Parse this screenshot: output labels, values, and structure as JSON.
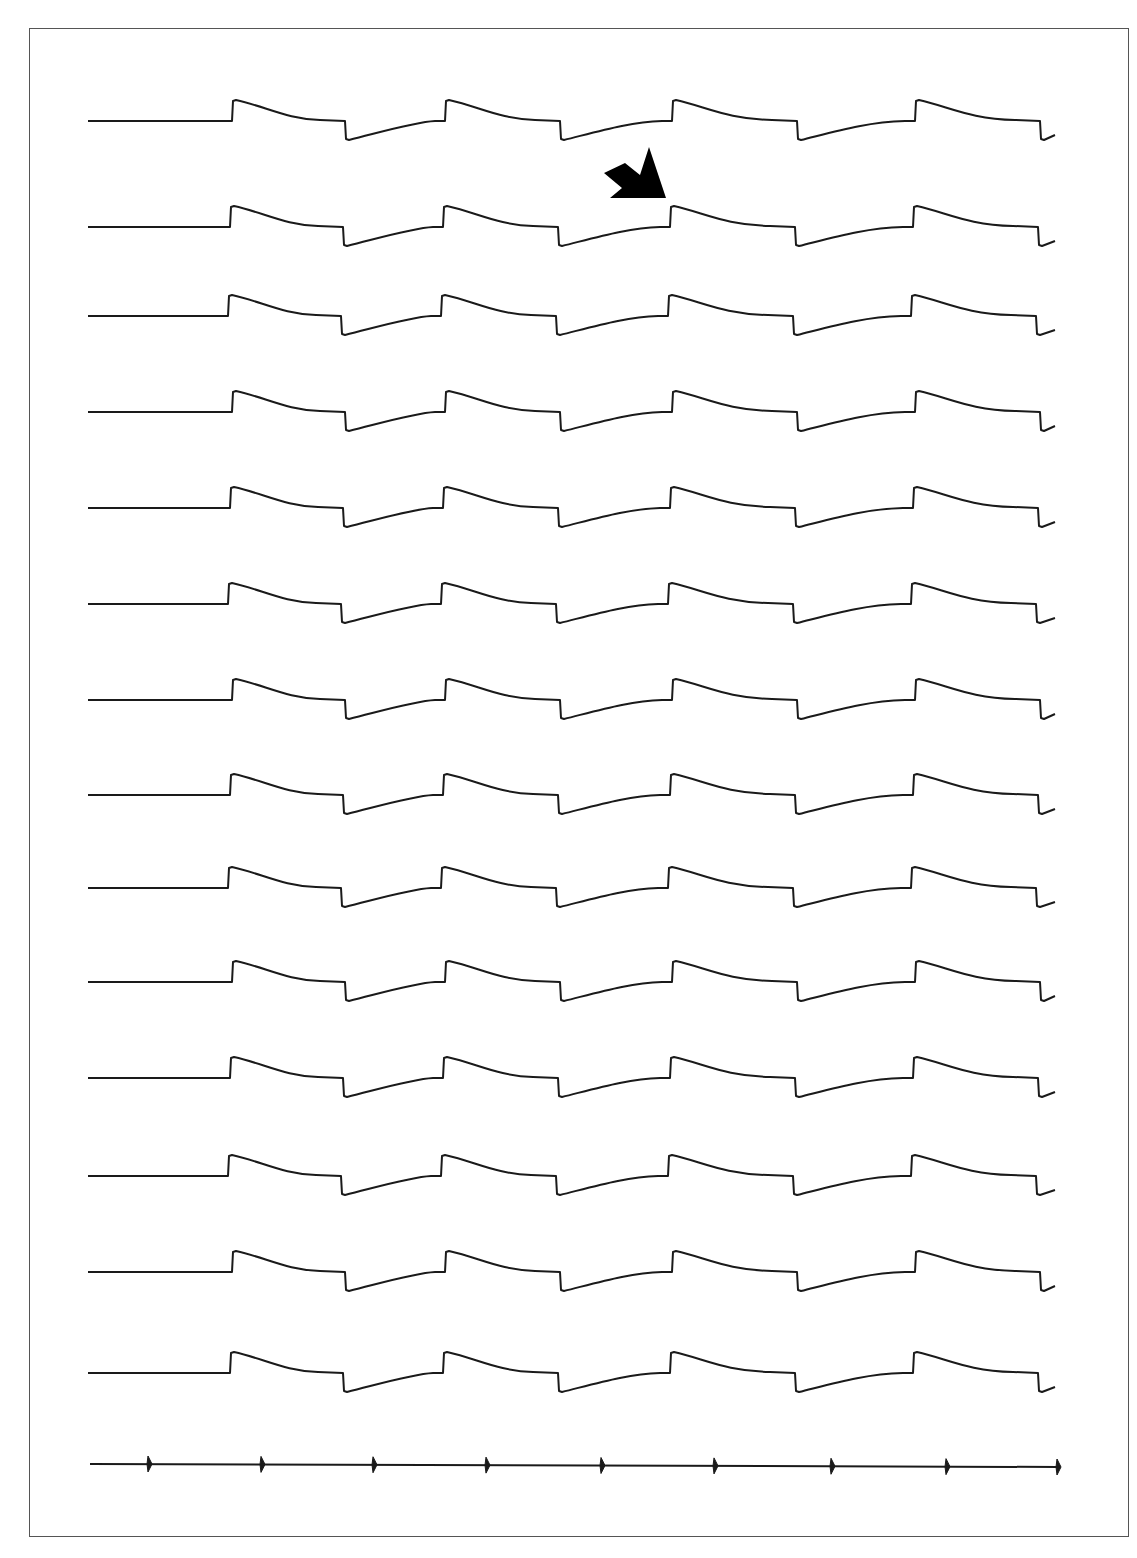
{
  "figure": {
    "type": "stacked-waveform-recording",
    "trace_count": 14,
    "trace_color": "#1a1a1a",
    "frame_color": "#555555",
    "baseline_x_start": 88,
    "baseline_end_x": 232,
    "trace_end_x": 1055,
    "rising_edges_x": [
      232,
      445,
      672,
      915
    ],
    "falling_edges_x": [
      345,
      560,
      797,
      1040
    ],
    "trace_baselines_y": [
      121,
      227,
      316,
      412,
      508,
      604,
      700,
      795,
      888,
      982,
      1078,
      1176,
      1272,
      1373
    ],
    "pulse_step_height": 20,
    "marker": {
      "type": "arrow",
      "points_to_trace": 2,
      "points_to_edge": 3,
      "color": "#000000"
    },
    "time_marker": {
      "y": 1466,
      "x_start": 90,
      "x_end": 1058,
      "ticks_x": [
        149,
        262,
        374,
        487,
        602,
        715,
        832,
        947,
        1058
      ]
    }
  },
  "caption": {
    "text": ""
  }
}
